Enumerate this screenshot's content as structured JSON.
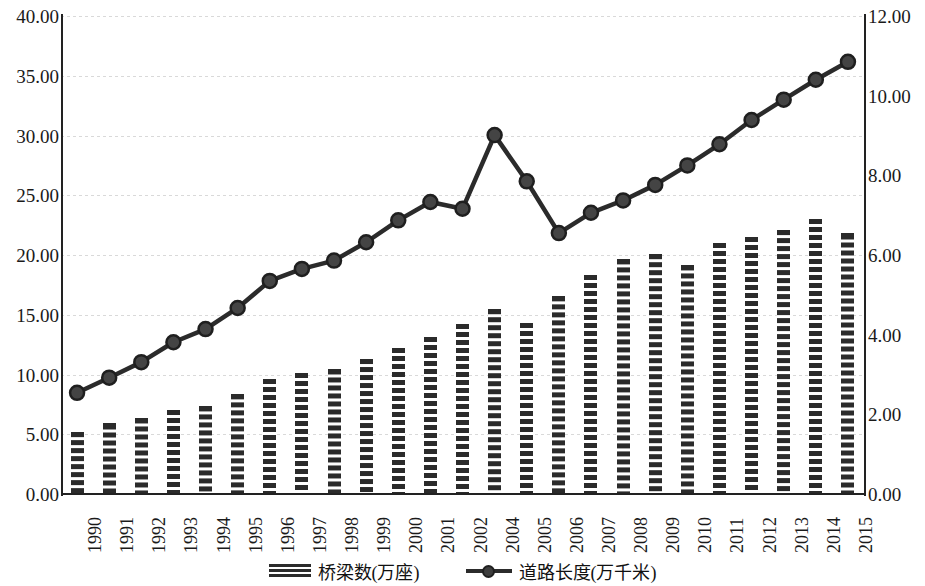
{
  "chart_data": {
    "type": "bar",
    "title": "",
    "subtitle": "",
    "xlabel": "",
    "ylabel": "",
    "y2label": "",
    "grid": true,
    "legend_position": "bottom",
    "categories": [
      "1990",
      "1991",
      "1992",
      "1993",
      "1994",
      "1995",
      "1996",
      "1997",
      "1998",
      "1999",
      "2000",
      "2001",
      "2002",
      "2004",
      "2005",
      "2006",
      "2007",
      "2008",
      "2009",
      "2010",
      "2011",
      "2012",
      "2013",
      "2014",
      "2015"
    ],
    "y_left_ticks": [
      "0.00",
      "5.00",
      "10.00",
      "15.00",
      "20.00",
      "25.00",
      "30.00",
      "35.00",
      "40.00"
    ],
    "y_right_ticks": [
      "0.00",
      "2.00",
      "4.00",
      "6.00",
      "8.00",
      "10.00",
      "12.00"
    ],
    "ylim": [
      0,
      40
    ],
    "y2lim": [
      0,
      12
    ],
    "series": [
      {
        "name": "桥梁数(万座)",
        "axis": "left",
        "render": "bar",
        "color": "#2b2b2b",
        "values": [
          5.2,
          5.9,
          6.4,
          7.0,
          7.4,
          8.4,
          9.6,
          10.1,
          10.5,
          11.3,
          12.2,
          13.1,
          14.2,
          15.5,
          14.3,
          16.6,
          18.3,
          19.7,
          20.1,
          19.2,
          21.0,
          21.5,
          22.1,
          23.0,
          21.8
        ]
      },
      {
        "name": "道路长度(万千米)",
        "axis": "right",
        "render": "line",
        "color": "#2b2b2b",
        "values": [
          2.54,
          2.92,
          3.31,
          3.81,
          4.14,
          4.67,
          5.35,
          5.65,
          5.86,
          6.32,
          6.87,
          7.33,
          7.16,
          9.01,
          7.85,
          6.55,
          7.06,
          7.37,
          7.76,
          8.25,
          8.78,
          9.39,
          9.9,
          10.4,
          10.85
        ]
      }
    ],
    "annotations": []
  },
  "legend": {
    "items": [
      {
        "label": "桥梁数(万座)",
        "marker": "bar-hatch-swatch"
      },
      {
        "label": "道路长度(万千米)",
        "marker": "line-with-circle-marker"
      }
    ]
  }
}
